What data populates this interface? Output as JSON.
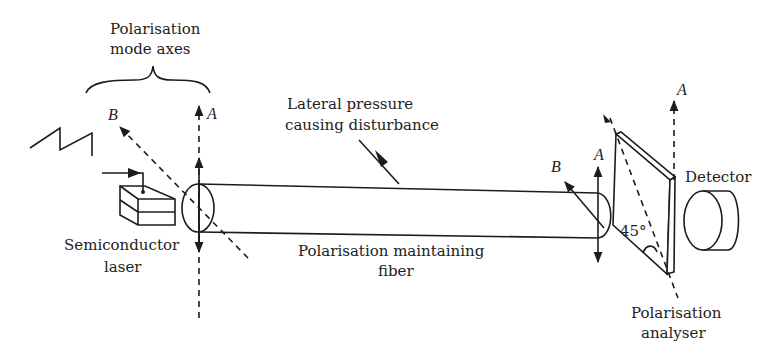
{
  "figure": {
    "labels": {
      "mode_axes_line1": "Polarisation",
      "mode_axes_line2": "mode axes",
      "axis_b_left": "B",
      "axis_a_left": "A",
      "pressure_line1": "Lateral pressure",
      "pressure_line2": "causing disturbance",
      "laser_line1": "Semiconductor",
      "laser_line2": "laser",
      "fiber_line1": "Polarisation maintaining",
      "fiber_line2": "fiber",
      "axis_b_right": "B",
      "axis_a_right": "A",
      "axis_a_analyser": "A",
      "angle": "45°",
      "detector": "Detector",
      "analyser_line1": "Polarisation",
      "analyser_line2": "analyser"
    }
  }
}
